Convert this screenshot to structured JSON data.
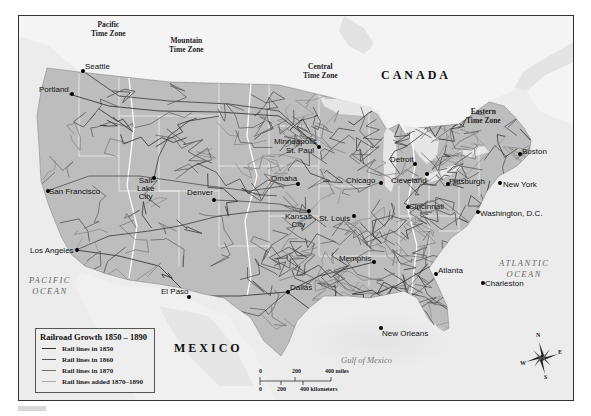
{
  "map": {
    "title": "Railroad Growth 1850–1890",
    "colors": {
      "ocean": "#ececec",
      "foreign_land": "#f2f2f2",
      "us_land": "#bdbdbd",
      "rail_1850": "#3a3a3a",
      "rail_1860": "#4a4a4a",
      "rail_1870": "#5a5a5a",
      "rail_1890": "#8a8a8a",
      "state_border": "#f5f5f5",
      "timezone_border": "#ffffff"
    },
    "regions": {
      "canada": "CANADA",
      "mexico": "MEXICO",
      "pacific_ocean": [
        "PACIFIC",
        "OCEAN"
      ],
      "atlantic_ocean": [
        "ATLANTIC",
        "OCEAN"
      ],
      "gulf": "Gulf of Mexico"
    },
    "time_zones": [
      {
        "line1": "Pacific",
        "line2": "Time Zone"
      },
      {
        "line1": "Mountain",
        "line2": "Time Zone"
      },
      {
        "line1": "Central",
        "line2": "Time Zone"
      },
      {
        "line1": "Eastern",
        "line2": "Time Zone"
      }
    ],
    "cities": [
      {
        "name": "Seattle"
      },
      {
        "name": "Portland"
      },
      {
        "name": "San Francisco"
      },
      {
        "name": "Salt Lake City",
        "lines": [
          "Salt",
          "Lake",
          "City"
        ]
      },
      {
        "name": "Denver"
      },
      {
        "name": "Los Angeles"
      },
      {
        "name": "El Paso"
      },
      {
        "name": "Dallas"
      },
      {
        "name": "Minneapolis"
      },
      {
        "name": "St. Paul"
      },
      {
        "name": "Omaha"
      },
      {
        "name": "Kansas City",
        "lines": [
          "Kansas",
          "City"
        ]
      },
      {
        "name": "St. Louis"
      },
      {
        "name": "Chicago"
      },
      {
        "name": "Memphis"
      },
      {
        "name": "New Orleans"
      },
      {
        "name": "Detroit"
      },
      {
        "name": "Cleveland"
      },
      {
        "name": "Cincinnati"
      },
      {
        "name": "Pittsburgh"
      },
      {
        "name": "Atlanta"
      },
      {
        "name": "Charleston"
      },
      {
        "name": "Washington, D.C."
      },
      {
        "name": "New York"
      },
      {
        "name": "Boston"
      }
    ],
    "legend": {
      "title": "Railroad Growth 1850 – 1890",
      "items": [
        {
          "label": "Rail lines in 1850",
          "color": "#333333"
        },
        {
          "label": "Rail lines in 1860",
          "color": "#555555"
        },
        {
          "label": "Rail lines in 1870",
          "color": "#6e6e6e"
        },
        {
          "label": "Rail lines added 1870–1890",
          "color": "#a8a8a8"
        }
      ]
    },
    "scale": {
      "miles_ticks": [
        "0",
        "200",
        "400 miles"
      ],
      "km_ticks": [
        "0",
        "200",
        "400 kilometers"
      ]
    },
    "compass": {
      "n": "N",
      "s": "S",
      "e": "E",
      "w": "W"
    }
  }
}
